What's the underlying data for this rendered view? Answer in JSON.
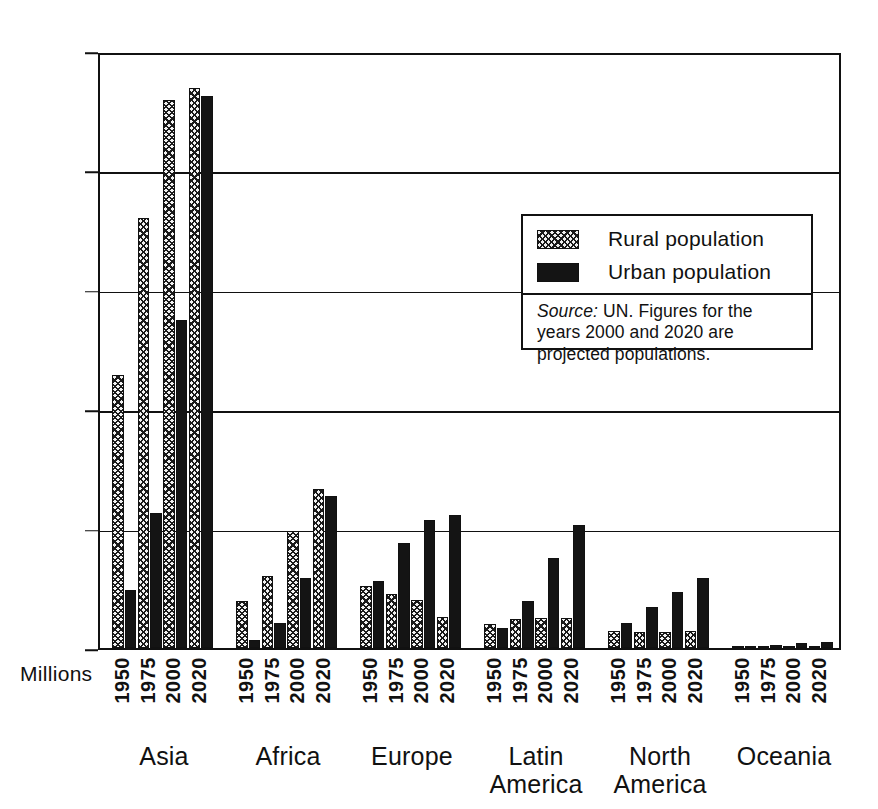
{
  "figure": {
    "millions_label": "Millions"
  },
  "legend": {
    "rural_label": "Rural population",
    "urban_label": "Urban population",
    "source_prefix": "Source:",
    "source_text": " UN. Figures for the years 2000 and 2020 are projected populations."
  },
  "colors": {
    "rural": "#efefef",
    "urban": "#141414",
    "axis": "#111111",
    "background": "#ffffff"
  },
  "chart_data": {
    "type": "bar",
    "title": "",
    "xlabel": "",
    "ylabel": "Millions",
    "ylim": [
      0,
      2500
    ],
    "yticks": [
      0,
      500,
      1000,
      1500,
      2000,
      2500
    ],
    "ytick_labels": [
      "0",
      "500",
      "1000",
      "1500",
      "2000",
      "2500"
    ],
    "grid": true,
    "legend_position": "upper-right-inside",
    "group_labels": [
      "Asia",
      "Africa",
      "Europe",
      "Latin\nAmerica",
      "North\nAmerica",
      "Oceania"
    ],
    "categories": [
      "1950",
      "1975",
      "2000",
      "2020"
    ],
    "series": [
      {
        "name": "Rural population",
        "pattern": "cross-hatch",
        "groups": {
          "Asia": [
            1145,
            1800,
            2295,
            2345
          ],
          "Africa": [
            195,
            300,
            490,
            665
          ],
          "Europe": [
            260,
            225,
            200,
            130
          ],
          "Latin America": [
            100,
            120,
            125,
            125
          ],
          "North America": [
            70,
            65,
            65,
            70
          ],
          "Oceania": [
            5,
            6,
            8,
            10
          ]
        }
      },
      {
        "name": "Urban population",
        "pattern": "solid",
        "groups": {
          "Asia": [
            245,
            565,
            1375,
            2310
          ],
          "Africa": [
            35,
            105,
            295,
            635
          ],
          "Europe": [
            280,
            440,
            535,
            555
          ],
          "Latin America": [
            85,
            195,
            375,
            515
          ],
          "North America": [
            105,
            170,
            235,
            295
          ],
          "Oceania": [
            10,
            14,
            20,
            27
          ]
        }
      }
    ]
  }
}
